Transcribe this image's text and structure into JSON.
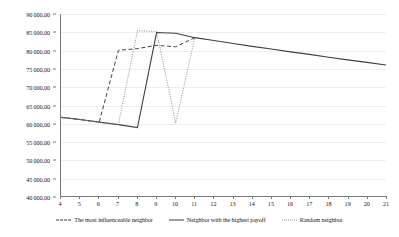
{
  "chart_data": {
    "type": "line",
    "title": "",
    "xlabel": "",
    "ylabel": "",
    "xlim": [
      4,
      21
    ],
    "ylim": [
      40000,
      90000
    ],
    "grid": true,
    "legend_position": "bottom",
    "x_tick_labels": [
      "4",
      "5",
      "6",
      "7",
      "8",
      "9",
      "10",
      "11",
      "12",
      "13",
      "14",
      "15",
      "16",
      "17",
      "18",
      "19",
      "20",
      "21"
    ],
    "x": [
      4,
      5,
      6,
      7,
      8,
      9,
      10,
      11,
      12,
      13,
      14,
      15,
      16,
      17,
      18,
      19,
      20,
      21
    ],
    "y_tick_labels": [
      "40 000,00",
      "45 000,00",
      "50 000,00",
      "55 000,00",
      "60 000,00",
      "65 000,00",
      "70 000,00",
      "75 000,00",
      "80 000,00",
      "85 000,00",
      "90 000,00"
    ],
    "y_ticks": [
      40000,
      45000,
      50000,
      55000,
      60000,
      65000,
      70000,
      75000,
      80000,
      85000,
      90000
    ],
    "series": [
      {
        "name": "The most influenceable neighbor",
        "style": "dashed",
        "color": "#3f3f3f",
        "x": [
          4,
          5,
          6,
          7,
          8,
          9,
          10,
          11
        ],
        "values": [
          61600,
          61000,
          60300,
          80000,
          80500,
          81400,
          81000,
          83500
        ]
      },
      {
        "name": "Neighbor with the highest payoff",
        "style": "solid",
        "color": "#3f3f3f",
        "x": [
          4,
          5,
          6,
          7,
          8,
          9,
          10,
          11,
          12,
          13,
          14,
          15,
          16,
          17,
          18,
          19,
          20,
          21
        ],
        "values": [
          61600,
          61000,
          60300,
          59600,
          58800,
          84900,
          84700,
          83500,
          82700,
          81900,
          81100,
          80400,
          79600,
          78900,
          78100,
          77400,
          76700,
          76000
        ]
      },
      {
        "name": "Random neighbor",
        "style": "dotted",
        "color": "#8a8a8a",
        "x": [
          4,
          5,
          6,
          7,
          8,
          9,
          10,
          11
        ],
        "values": [
          61600,
          61000,
          60300,
          59600,
          85400,
          85200,
          60100,
          83500
        ]
      }
    ]
  },
  "legend": {
    "entries": [
      {
        "label": "The most influenceable neighbor"
      },
      {
        "label": "Neighbor with the highest payoff"
      },
      {
        "label": "Random neighbor"
      }
    ]
  }
}
